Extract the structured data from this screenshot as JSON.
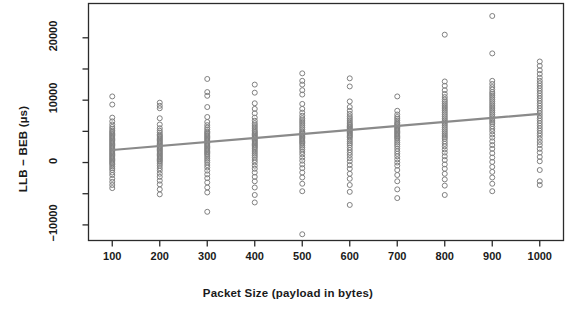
{
  "chart_data": {
    "type": "scatter",
    "title": "",
    "xlabel": "Packet Size (payload in bytes)",
    "ylabel": "LLB − BEB (µs)",
    "xlim": [
      50,
      1050
    ],
    "ylim": [
      -12500,
      25500
    ],
    "grid": false,
    "legend": null,
    "xticks": [
      100,
      200,
      300,
      400,
      500,
      600,
      700,
      800,
      900,
      1000
    ],
    "xtick_labels": [
      "100",
      "200",
      "300",
      "400",
      "500",
      "600",
      "700",
      "800",
      "900",
      "1000"
    ],
    "yticks": [
      -10000,
      -5000,
      0,
      5000,
      10000,
      15000,
      20000
    ],
    "ytick_labels": [
      "-10000",
      "",
      "0",
      "",
      "10000",
      "",
      "20000"
    ],
    "ytick_labeled": [
      -10000,
      0,
      10000,
      20000
    ],
    "marker": "open-circle",
    "marker_color": "#808080",
    "marker_size": 5,
    "trendline": {
      "type": "linear-regression",
      "color": "#8a8a8a",
      "x_start": 100,
      "y_start": 2000,
      "x_end": 1000,
      "y_end": 7800,
      "slope": 6.44,
      "intercept": 1356
    },
    "series": [
      {
        "name": "LLB - BEB difference",
        "points_by_x": [
          {
            "x": 100,
            "values": [
              10600,
              9300,
              7200,
              6600,
              6100,
              5700,
              5400,
              5100,
              4900,
              4700,
              4500,
              4300,
              4100,
              3900,
              3700,
              3500,
              3300,
              3100,
              2900,
              2700,
              2500,
              2300,
              2100,
              1900,
              1700,
              1500,
              1300,
              1100,
              900,
              700,
              500,
              300,
              100,
              -100,
              -300,
              -600,
              -900,
              -1200,
              -1600,
              -2000,
              -2600,
              -3100,
              -3600,
              -4100
            ]
          },
          {
            "x": 200,
            "values": [
              9600,
              9100,
              8700,
              7100,
              6100,
              5500,
              5100,
              4800,
              4500,
              4300,
              4100,
              3900,
              3700,
              3500,
              3300,
              3100,
              2900,
              2700,
              2500,
              2300,
              2100,
              1900,
              1700,
              1500,
              1300,
              1100,
              900,
              700,
              500,
              300,
              100,
              -200,
              -500,
              -900,
              -1300,
              -1800,
              -2300,
              -2900,
              -3500,
              -4300,
              -5100
            ]
          },
          {
            "x": 300,
            "values": [
              13400,
              11300,
              10700,
              8900,
              7300,
              6500,
              6000,
              5600,
              5300,
              5000,
              4800,
              4600,
              4400,
              4200,
              4000,
              3800,
              3600,
              3400,
              3200,
              3000,
              2800,
              2600,
              2400,
              2200,
              2000,
              1800,
              1600,
              1400,
              1200,
              900,
              600,
              300,
              0,
              -400,
              -800,
              -1300,
              -1900,
              -2500,
              -3200,
              -4000,
              -4800,
              -7900
            ]
          },
          {
            "x": 400,
            "values": [
              12500,
              11200,
              9500,
              8600,
              7900,
              7200,
              6700,
              6300,
              6000,
              5700,
              5400,
              5100,
              4900,
              4700,
              4500,
              4300,
              4100,
              3900,
              3700,
              3500,
              3300,
              3100,
              2900,
              2700,
              2500,
              2300,
              2000,
              1700,
              1400,
              1100,
              800,
              400,
              0,
              -500,
              -1000,
              -1600,
              -2300,
              -3000,
              -4000,
              -5200,
              -6400
            ]
          },
          {
            "x": 500,
            "values": [
              14300,
              13100,
              12500,
              11600,
              10900,
              9400,
              8600,
              8000,
              7500,
              7100,
              6800,
              6500,
              6200,
              5900,
              5600,
              5300,
              5000,
              4800,
              4600,
              4400,
              4200,
              4000,
              3800,
              3600,
              3400,
              3200,
              3000,
              2700,
              2400,
              2100,
              1700,
              1300,
              800,
              300,
              -300,
              -900,
              -1600,
              -2400,
              -3400,
              -4600,
              -11500
            ]
          },
          {
            "x": 600,
            "values": [
              13500,
              12200,
              9800,
              8900,
              8300,
              7800,
              7400,
              7100,
              6800,
              6500,
              6200,
              6000,
              5800,
              5600,
              5400,
              5200,
              5000,
              4800,
              4600,
              4400,
              4200,
              4000,
              3700,
              3400,
              3100,
              2800,
              2400,
              2000,
              1600,
              1200,
              700,
              200,
              -400,
              -1000,
              -1800,
              -2600,
              -3600,
              -4700,
              -6800
            ]
          },
          {
            "x": 700,
            "values": [
              10600,
              8300,
              7700,
              7300,
              7000,
              6700,
              6400,
              6200,
              6000,
              5800,
              5600,
              5400,
              5200,
              5000,
              4800,
              4600,
              4400,
              4200,
              4000,
              3800,
              3500,
              3200,
              2900,
              2600,
              2200,
              1800,
              1400,
              1000,
              500,
              0,
              -500,
              -1200,
              -2000,
              -3000,
              -4300,
              -5700
            ]
          },
          {
            "x": 800,
            "values": [
              20500,
              13000,
              12300,
              11600,
              11000,
              10500,
              10100,
              9800,
              9500,
              9200,
              8900,
              8600,
              8300,
              8000,
              7700,
              7400,
              7100,
              6800,
              6500,
              6200,
              5900,
              5600,
              5300,
              5000,
              4700,
              4400,
              4100,
              3800,
              3400,
              3000,
              2600,
              2100,
              1600,
              1000,
              400,
              -300,
              -1000,
              -1800,
              -2700,
              -3700,
              -5200
            ]
          },
          {
            "x": 900,
            "values": [
              23500,
              17500,
              13100,
              12600,
              12100,
              11700,
              11300,
              11000,
              10700,
              10400,
              10100,
              9800,
              9500,
              9200,
              8900,
              8600,
              8300,
              8000,
              7700,
              7400,
              7100,
              6800,
              6500,
              6200,
              5800,
              5400,
              5000,
              4500,
              4000,
              3400,
              2800,
              2200,
              1500,
              800,
              100,
              -700,
              -1500,
              -2400,
              -3400,
              -4600
            ]
          },
          {
            "x": 1000,
            "values": [
              16200,
              15500,
              14800,
              14200,
              13600,
              13100,
              12700,
              12300,
              11900,
              11500,
              11100,
              10700,
              10300,
              9900,
              9500,
              9100,
              8700,
              8300,
              7900,
              7500,
              7100,
              6700,
              6300,
              5900,
              5500,
              5100,
              4700,
              4300,
              3800,
              3300,
              2800,
              2200,
              1600,
              900,
              200,
              -1200,
              -3000,
              -3600
            ]
          }
        ]
      }
    ]
  },
  "axes": {
    "ylabel": "LLB − BEB (µs)",
    "xlabel": "Packet Size (payload in bytes)"
  }
}
